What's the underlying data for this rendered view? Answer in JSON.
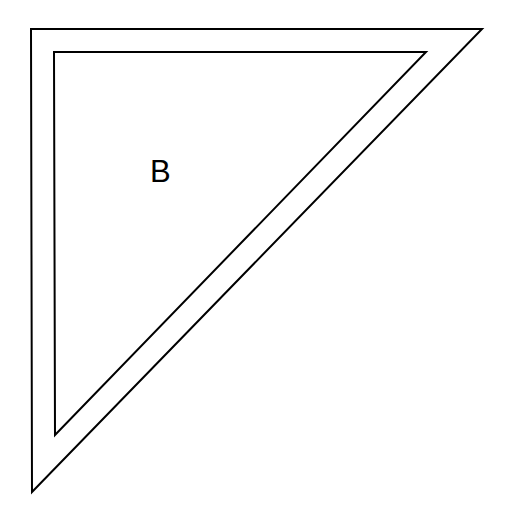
{
  "diagram": {
    "type": "nested-right-triangles",
    "label": "B",
    "stroke_color": "#000000",
    "background_color": "#ffffff",
    "outer_triangle": {
      "points": [
        [
          31,
          29
        ],
        [
          482,
          29
        ],
        [
          32,
          492
        ]
      ]
    },
    "inner_triangle": {
      "points": [
        [
          54,
          52
        ],
        [
          426,
          52
        ],
        [
          55,
          435
        ]
      ]
    }
  }
}
